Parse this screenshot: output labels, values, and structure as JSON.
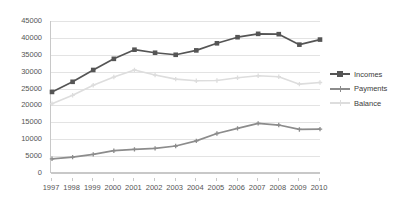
{
  "chart_data": {
    "type": "line",
    "title": "",
    "subtitle": "",
    "xlabel": "",
    "ylabel": "",
    "categories": [
      "1997",
      "1998",
      "1999",
      "2000",
      "2001",
      "2002",
      "2003",
      "2004",
      "2005",
      "2006",
      "2007",
      "2008",
      "2009",
      "2010"
    ],
    "ylim": [
      0,
      45000
    ],
    "yticks": [
      0,
      5000,
      10000,
      15000,
      20000,
      25000,
      30000,
      35000,
      40000,
      45000
    ],
    "ytick_labels": [
      "0",
      "5000",
      "10000",
      "15000",
      "20000",
      "25000",
      "30000",
      "35000",
      "40000",
      "45000"
    ],
    "grid": true,
    "legend_position": "right",
    "series": [
      {
        "name": "Incomes",
        "color": "#555555",
        "marker": "square",
        "values": [
          24000,
          27000,
          30500,
          33800,
          36500,
          35600,
          35000,
          36300,
          38400,
          40200,
          41200,
          41100,
          38000,
          39500
        ]
      },
      {
        "name": "Payments",
        "color": "#8c8c8c",
        "marker": "plus",
        "values": [
          4200,
          4700,
          5500,
          6600,
          7000,
          7300,
          8000,
          9500,
          11700,
          13200,
          14700,
          14200,
          12900,
          13000
        ]
      },
      {
        "name": "Balance",
        "color": "#dddddd",
        "marker": "plus",
        "values": [
          20500,
          23000,
          26000,
          28400,
          30500,
          29000,
          27800,
          27300,
          27400,
          28200,
          28800,
          28500,
          26300,
          26800
        ]
      }
    ]
  },
  "legend": {
    "items": [
      {
        "label": "Incomes"
      },
      {
        "label": "Payments"
      },
      {
        "label": "Balance"
      }
    ]
  }
}
